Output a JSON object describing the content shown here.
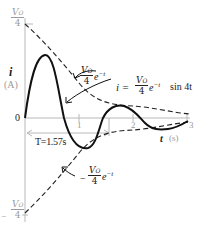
{
  "diagram": {
    "y_axis": {
      "label": "i",
      "unit": "(A)",
      "top_tick": {
        "num": "V",
        "sub": "O",
        "den": "4"
      },
      "bottom_tick": {
        "sign": "−",
        "num": "V",
        "sub": "O",
        "den": "4"
      },
      "zero_label": "0"
    },
    "x_axis": {
      "label": "t",
      "unit": "(s)",
      "ticks": [
        "1",
        "2",
        "3"
      ]
    },
    "curves": {
      "upper_envelope": {
        "prefix": "",
        "num": "V",
        "sub": "O",
        "den": "4",
        "exp_base": "e",
        "exponent": "−t"
      },
      "lower_envelope": {
        "prefix": "−",
        "num": "V",
        "sub": "O",
        "den": "4",
        "exp_base": "e",
        "exponent": "−t"
      },
      "response": {
        "lhs": "i =",
        "num": "V",
        "sub": "O",
        "den": "4",
        "exp_base": "e",
        "exponent": "−t",
        "trig": "sin 4t"
      }
    },
    "period_annotation": "T=1.57s",
    "colors": {
      "axis": "#b0b0b0",
      "curve": "#111111",
      "envelope": "#222222",
      "label_gray": "#9a9a9a"
    }
  }
}
